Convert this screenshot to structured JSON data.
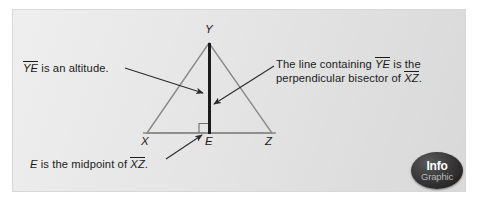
{
  "figure": {
    "title_hidden": "",
    "panel": {
      "background_color": "#e6e6e6",
      "border_color": "#d8d8d8"
    },
    "colors": {
      "triangle_stroke": "#8a8a8a",
      "altitude_stroke": "#1b1b1b",
      "leader_stroke": "#2b2b2b",
      "text": "#1b1b1b",
      "badge_fill": "#1a1a1a",
      "badge_info_text": "#ffffff",
      "badge_graphic_text": "#b9b9b9"
    },
    "vertices": {
      "y": "Y",
      "x": "X",
      "e": "E",
      "z": "Z"
    },
    "geometry": {
      "type": "triangle-with-altitude",
      "apex": [
        209,
        43
      ],
      "base_left": [
        147,
        133
      ],
      "base_right": [
        272,
        133
      ],
      "foot": [
        209,
        133
      ],
      "right_angle_marker": true,
      "altitude_is_bold": true
    },
    "annotations": [
      {
        "id": "altitude-note",
        "segments": [
          {
            "text": "YE",
            "overline": true,
            "italic": true
          },
          {
            "text": " is an altitude.",
            "overline": false,
            "italic": false
          }
        ],
        "plain_text": "YE is an altitude.",
        "leader_from": [
          125,
          68
        ],
        "leader_to": [
          205,
          93
        ]
      },
      {
        "id": "perpendicular-bisector-note",
        "line1": [
          {
            "text": "The line containing ",
            "overline": false,
            "italic": false
          },
          {
            "text": "YE",
            "overline": true,
            "italic": true
          },
          {
            "text": " is the",
            "overline": false,
            "italic": false
          }
        ],
        "line2": [
          {
            "text": "perpendicular bisector of ",
            "overline": false,
            "italic": false
          },
          {
            "text": "XZ",
            "overline": true,
            "italic": true
          },
          {
            "text": ".",
            "overline": false,
            "italic": false
          }
        ],
        "plain_text": "The line containing YE is the perpendicular bisector of XZ.",
        "leader_from": [
          274,
          66
        ],
        "leader_to": [
          213,
          105
        ]
      },
      {
        "id": "midpoint-note",
        "segments": [
          {
            "text": "E",
            "overline": false,
            "italic": true
          },
          {
            "text": " is the midpoint of ",
            "overline": false,
            "italic": false
          },
          {
            "text": "XZ",
            "overline": true,
            "italic": true
          },
          {
            "text": ".",
            "overline": false,
            "italic": false
          }
        ],
        "plain_text": "E is the midpoint of XZ.",
        "leader_from": [
          166,
          159
        ],
        "leader_to": [
          203,
          134
        ]
      }
    ],
    "badge": {
      "line1": "Info",
      "line2": "Graphic"
    }
  }
}
